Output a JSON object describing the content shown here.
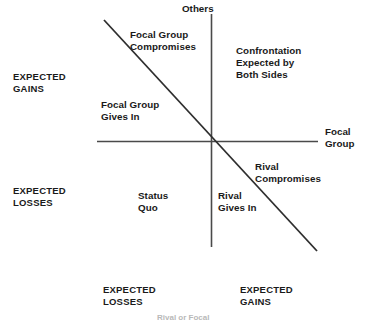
{
  "figure": {
    "type": "conflict-payoff-quadrant-diagram",
    "background_color": "#ffffff",
    "line_color": "#3a3a3a"
  },
  "axes": {
    "vertical": {
      "name": "Others",
      "positive_label": "EXPECTED\nGAINS",
      "negative_label": "EXPECTED\nLOSSES"
    },
    "horizontal": {
      "name": "Focal\nGroup",
      "negative_label": "EXPECTED\nLOSSES",
      "positive_label": "EXPECTED\nGAINS"
    }
  },
  "regions": {
    "upper_left_outer": "Focal Group\nCompromises",
    "upper_left_inner": "Focal Group\nGives In",
    "upper_right": "Confrontation\nExpected by\nBoth Sides",
    "lower_left": "Status\nQuo",
    "lower_right_inner": "Rival\nGives In",
    "lower_right_outer": "Rival\nCompromises"
  },
  "caption": {
    "text": "Rival or Focal"
  }
}
